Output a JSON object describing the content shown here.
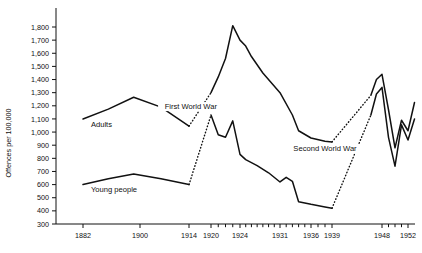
{
  "chart_data": {
    "type": "line",
    "title": "",
    "subtitle": "",
    "xlabel": "",
    "ylabel": "Offences per 100,000",
    "ylim": [
      300,
      1800
    ],
    "ytick_labels": [
      "300",
      "400",
      "500",
      "600",
      "700",
      "800",
      "900",
      "1,000",
      "1,100",
      "1,200",
      "1,300",
      "1,400",
      "1,500",
      "1,600",
      "1,700",
      "1,800"
    ],
    "ytick_values": [
      300,
      400,
      500,
      600,
      700,
      800,
      900,
      1000,
      1100,
      1200,
      1300,
      1400,
      1500,
      1600,
      1700,
      1800
    ],
    "xlim": [
      1882,
      1953
    ],
    "xtick_labels": [
      "1882",
      "1900",
      "1914",
      "1920",
      "1924",
      "1931",
      "1936",
      "1939",
      "1948",
      "1952"
    ],
    "xtick_values": [
      1882,
      1900,
      1914,
      1920,
      1924,
      1931,
      1936,
      1939,
      1948,
      1952
    ],
    "grid": false,
    "legend": "inline-labels",
    "annotations": [
      {
        "text": "First World War",
        "x": 1914.5,
        "y": 1175,
        "name": "first-world-war-annotation"
      },
      {
        "text": "Second World War",
        "x": 1938.0,
        "y": 855,
        "name": "second-world-war-annotation"
      }
    ],
    "series": [
      {
        "name": "Adults",
        "label": "Adults",
        "label_x": 1884.5,
        "label_y": 1035,
        "color": "#111111",
        "points": [
          [
            1882,
            1100
          ],
          [
            1890,
            1175
          ],
          [
            1898,
            1265
          ],
          [
            1906,
            1190
          ],
          [
            1914,
            1045
          ],
          [
            1920,
            1300
          ],
          [
            1921,
            1420
          ],
          [
            1922,
            1560
          ],
          [
            1923,
            1810
          ],
          [
            1924,
            1700
          ],
          [
            1925,
            1655
          ],
          [
            1926,
            1575
          ],
          [
            1928,
            1450
          ],
          [
            1931,
            1300
          ],
          [
            1933,
            1130
          ],
          [
            1934,
            1010
          ],
          [
            1936,
            955
          ],
          [
            1938,
            930
          ],
          [
            1939,
            925
          ],
          [
            1946,
            1280
          ],
          [
            1947,
            1400
          ],
          [
            1948,
            1440
          ],
          [
            1949,
            1170
          ],
          [
            1950,
            880
          ],
          [
            1951,
            1090
          ],
          [
            1952,
            1010
          ],
          [
            1953,
            1225
          ]
        ],
        "war_gaps": [
          {
            "from": [
              1914,
              1045
            ],
            "to": [
              1920,
              1300
            ]
          },
          {
            "from": [
              1939,
              925
            ],
            "to": [
              1946,
              1280
            ]
          }
        ]
      },
      {
        "name": "Young people",
        "label": "Young people",
        "label_x": 1884.5,
        "label_y": 545,
        "color": "#111111",
        "points": [
          [
            1882,
            600
          ],
          [
            1890,
            645
          ],
          [
            1898,
            680
          ],
          [
            1906,
            645
          ],
          [
            1914,
            600
          ],
          [
            1920,
            1130
          ],
          [
            1921,
            980
          ],
          [
            1922,
            960
          ],
          [
            1923,
            1085
          ],
          [
            1924,
            830
          ],
          [
            1925,
            790
          ],
          [
            1927,
            745
          ],
          [
            1929,
            690
          ],
          [
            1931,
            620
          ],
          [
            1932,
            655
          ],
          [
            1933,
            625
          ],
          [
            1934,
            470
          ],
          [
            1936,
            450
          ],
          [
            1938,
            430
          ],
          [
            1939,
            420
          ],
          [
            1946,
            1130
          ],
          [
            1947,
            1290
          ],
          [
            1948,
            1340
          ],
          [
            1949,
            960
          ],
          [
            1950,
            740
          ],
          [
            1951,
            1055
          ],
          [
            1952,
            940
          ],
          [
            1953,
            1100
          ]
        ],
        "war_gaps": [
          {
            "from": [
              1914,
              600
            ],
            "to": [
              1920,
              1130
            ]
          },
          {
            "from": [
              1939,
              420
            ],
            "to": [
              1946,
              1130
            ]
          }
        ]
      }
    ]
  }
}
